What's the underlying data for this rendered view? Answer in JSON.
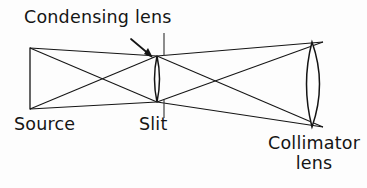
{
  "figure": {
    "kind": "optical-ray-diagram",
    "background_color": "#fdfdfd",
    "ink_color": "#151515"
  },
  "labels": {
    "condensing_lens": "Condensing lens",
    "source": "Source",
    "slit": "Slit",
    "collimator_lens_line1": "Collimator",
    "collimator_lens_line2": "lens"
  },
  "components": {
    "source": {
      "name": "Source",
      "shape": "vertical-line",
      "x": 30,
      "y_top": 48,
      "y_bottom": 109
    },
    "condensing_lens": {
      "name": "Condensing lens",
      "shape": "thin-biconvex-lens",
      "x_center": 157,
      "y_top": 56,
      "y_bottom": 102,
      "half_width": 4
    },
    "slit": {
      "name": "Slit",
      "shape": "vertical-tick-pair",
      "x": 164,
      "upper_tick": [
        33,
        56
      ],
      "lower_tick": [
        100,
        118
      ]
    },
    "collimator_lens": {
      "name": "Collimator lens",
      "shape": "thick-biconvex-lens",
      "x_left_apex": 302,
      "x_right_apex": 325,
      "y_top": 42,
      "y_bottom": 127,
      "bulge": 12
    },
    "pointer_arrow": {
      "name": "Condensing lens pointer",
      "from": [
        131,
        39
      ],
      "to": [
        152,
        57
      ]
    }
  },
  "rays": {
    "left_bundle": [
      {
        "from": [
          30,
          48
        ],
        "to": [
          157,
          102
        ]
      },
      {
        "from": [
          30,
          48
        ],
        "to": [
          157,
          56
        ]
      },
      {
        "from": [
          30,
          109
        ],
        "to": [
          157,
          56
        ]
      },
      {
        "from": [
          30,
          109
        ],
        "to": [
          157,
          102
        ]
      }
    ],
    "right_bundle": [
      {
        "from": [
          157,
          56
        ],
        "to": [
          323,
          127
        ]
      },
      {
        "from": [
          157,
          56
        ],
        "to": [
          323,
          42
        ]
      },
      {
        "from": [
          157,
          102
        ],
        "to": [
          323,
          42
        ]
      },
      {
        "from": [
          157,
          102
        ],
        "to": [
          323,
          127
        ]
      }
    ]
  }
}
